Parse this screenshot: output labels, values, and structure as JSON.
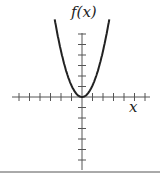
{
  "chart_data": {
    "type": "line",
    "title": "",
    "xlabel": "x",
    "ylabel": "f(x)",
    "function": "f(x) = x^2",
    "series": [
      {
        "name": "f(x)",
        "x": [
          -2.5,
          -2,
          -1.5,
          -1,
          -0.5,
          0,
          0.5,
          1,
          1.5,
          2,
          2.5
        ],
        "y": [
          6.25,
          4,
          2.25,
          1,
          0.25,
          0,
          0.25,
          1,
          2.25,
          4,
          6.25
        ]
      }
    ],
    "x_ticks_count_each_side": 6,
    "y_ticks_count_each_side": 6,
    "grid": false,
    "tick_labels": false
  },
  "labels": {
    "y_axis": "f(x)",
    "x_axis": "x"
  }
}
